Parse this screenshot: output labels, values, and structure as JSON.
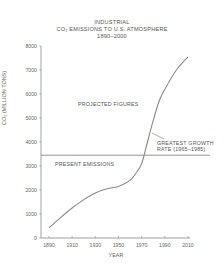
{
  "chart_data": {
    "type": "line",
    "title_lines": [
      "INDUSTRIAL",
      "CO₂ EMISSIONS TO U.S. ATMOSPHERE",
      "1890–2000"
    ],
    "xlabel": "YEAR",
    "ylabel": "CO₂ (MILLION TONS)",
    "xlim": [
      1890,
      2010
    ],
    "ylim": [
      0,
      8000
    ],
    "x_ticks": [
      1890,
      1910,
      1930,
      1950,
      1970,
      1990,
      2010
    ],
    "y_ticks": [
      0,
      1000,
      2000,
      3000,
      4000,
      5000,
      6000,
      7000,
      8000
    ],
    "grid": false,
    "series": [
      {
        "name": "CO2 emissions",
        "x": [
          1890,
          1900,
          1910,
          1920,
          1930,
          1940,
          1950,
          1960,
          1965,
          1970,
          1975,
          1980,
          1985,
          1990,
          2000,
          2010
        ],
        "values": [
          420,
          850,
          1250,
          1600,
          1880,
          2050,
          2150,
          2400,
          2700,
          3100,
          4000,
          4900,
          5700,
          6200,
          7000,
          7550
        ]
      }
    ],
    "reference_line": {
      "name": "PRESENT EMISSIONS",
      "y": 3450
    },
    "annotations": [
      {
        "text": "PROJECTED FIGURES",
        "x": 1935,
        "y": 5000
      },
      {
        "text": "PRESENT EMISSIONS",
        "x": 1900,
        "y": 3100
      },
      {
        "text": "GREATEST GROWTH RATE (1965–1985)",
        "x": 1975,
        "y": 3900
      }
    ]
  },
  "labels": {
    "present": "PRESENT EMISSIONS",
    "projected": "PROJECTED FIGURES",
    "growth_1": "GREATEST GROWTH",
    "growth_2": "RATE (1965–1985)"
  }
}
